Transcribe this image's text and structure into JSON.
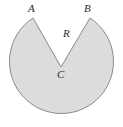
{
  "figure": {
    "name": "notched-circle-diagram",
    "background_color": "#ffffff",
    "shape": {
      "fill_color": "#dcdcdc",
      "stroke_color": "#8a8a8a",
      "stroke_width": 1,
      "center": {
        "x": 61,
        "y": 67
      },
      "radius": 52,
      "notch": {
        "vertex": {
          "x": 61,
          "y": 67
        },
        "left_point": {
          "x": 33,
          "y": 18
        },
        "right_point": {
          "x": 90,
          "y": 18
        }
      }
    },
    "labels": [
      {
        "id": "A",
        "text": "A",
        "x": 28,
        "y": 3,
        "role": "arc-endpoint-left"
      },
      {
        "id": "B",
        "text": "B",
        "x": 84,
        "y": 3,
        "role": "arc-endpoint-right"
      },
      {
        "id": "R",
        "text": "R",
        "x": 63,
        "y": 28,
        "role": "radius"
      },
      {
        "id": "C",
        "text": "C",
        "x": 57,
        "y": 69,
        "role": "center"
      }
    ]
  }
}
